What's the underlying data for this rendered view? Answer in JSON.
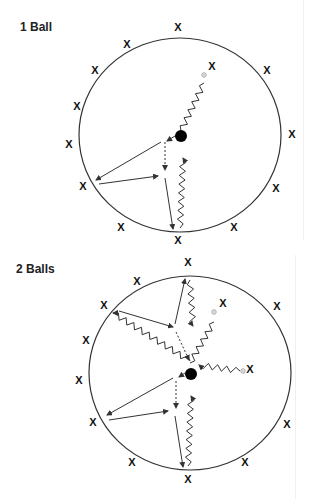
{
  "panels": [
    {
      "title": "1 Ball",
      "title_pos": [
        20,
        18
      ],
      "circle": {
        "cx": 180,
        "cy": 135,
        "rx": 101,
        "ry": 97
      },
      "ball": {
        "cx": 181,
        "cy": 136,
        "r": 6
      },
      "players": [
        [
          178,
          27
        ],
        [
          127,
          44
        ],
        [
          95,
          70
        ],
        [
          77,
          106
        ],
        [
          69,
          144
        ],
        [
          83,
          186
        ],
        [
          121,
          227
        ],
        [
          178,
          240
        ],
        [
          234,
          227
        ],
        [
          276,
          188
        ],
        [
          292,
          134
        ],
        [
          267,
          70
        ],
        [
          212,
          66
        ]
      ],
      "targets": [
        [
          204,
          75
        ]
      ],
      "zigzags": [
        {
          "from": [
            204,
            83
          ],
          "to": [
            181,
            131
          ],
          "arrow": false
        },
        {
          "from": [
            180,
            228
          ],
          "to": [
            183,
            158
          ],
          "arrow": true
        }
      ],
      "passes": [
        {
          "from": [
            175,
            136
          ],
          "to": [
            167,
            141
          ],
          "dashed": false
        },
        {
          "from": [
            161,
            142
          ],
          "to": [
            96,
            180
          ],
          "dashed": false
        },
        {
          "from": [
            99,
            184
          ],
          "to": [
            158,
            176
          ],
          "dashed": false
        },
        {
          "from": [
            165,
            142
          ],
          "to": [
            165,
            170
          ],
          "dashed": true
        },
        {
          "from": [
            165,
            178
          ],
          "to": [
            173,
            229
          ],
          "dashed": false
        }
      ]
    },
    {
      "title": "2 Balls",
      "title_pos": [
        16,
        269
      ],
      "circle": {
        "cx": 190,
        "cy": 373,
        "rx": 101,
        "ry": 97
      },
      "ball": {
        "cx": 191,
        "cy": 374,
        "r": 6
      },
      "players": [
        [
          188,
          262
        ],
        [
          137,
          281
        ],
        [
          104,
          305
        ],
        [
          86,
          340
        ],
        [
          79,
          380
        ],
        [
          93,
          422
        ],
        [
          132,
          462
        ],
        [
          188,
          479
        ],
        [
          245,
          462
        ],
        [
          287,
          424
        ],
        [
          250,
          369
        ],
        [
          277,
          306
        ],
        [
          223,
          303
        ]
      ],
      "targets": [
        [
          214,
          312
        ],
        [
          243,
          371
        ]
      ],
      "zigzags": [
        {
          "from": [
            214,
            322
          ],
          "to": [
            190,
            363
          ],
          "arrow": false
        },
        {
          "from": [
            240,
            371
          ],
          "to": [
            199,
            365
          ],
          "arrow": true
        },
        {
          "from": [
            190,
            361
          ],
          "to": [
            113,
            313
          ],
          "arrow": true
        },
        {
          "from": [
            190,
            280
          ],
          "to": [
            193,
            326
          ],
          "arrow": true
        },
        {
          "from": [
            188,
            466
          ],
          "to": [
            191,
            396
          ],
          "arrow": true
        }
      ],
      "passes": [
        {
          "from": [
            119,
            311
          ],
          "to": [
            173,
            327
          ],
          "dashed": false
        },
        {
          "from": [
            175,
            324
          ],
          "to": [
            185,
            279
          ],
          "dashed": false
        },
        {
          "from": [
            176,
            332
          ],
          "to": [
            189,
            360
          ],
          "dashed": true
        },
        {
          "from": [
            185,
            373
          ],
          "to": [
            179,
            377
          ],
          "dashed": false
        },
        {
          "from": [
            173,
            378
          ],
          "to": [
            107,
            415
          ],
          "dashed": false
        },
        {
          "from": [
            109,
            420
          ],
          "to": [
            168,
            411
          ],
          "dashed": false
        },
        {
          "from": [
            176,
            381
          ],
          "to": [
            176,
            408
          ],
          "dashed": true
        },
        {
          "from": [
            175,
            416
          ],
          "to": [
            183,
            467
          ],
          "dashed": false
        }
      ]
    }
  ],
  "symbols": {
    "player_glyph": "X",
    "ball_color": "#000000",
    "line_color": "#333333",
    "target_color": "#888888"
  }
}
